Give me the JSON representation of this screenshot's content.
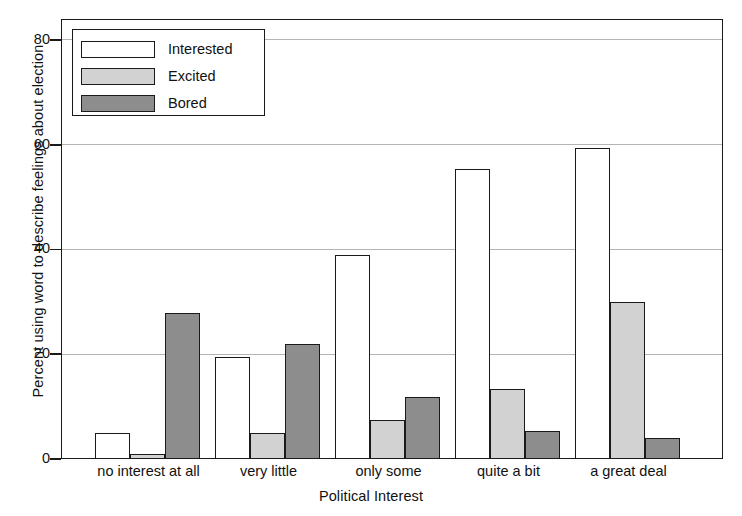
{
  "chart_data": {
    "type": "bar",
    "title": "",
    "xlabel": "Political Interest",
    "ylabel": "Percent using word to describe feelings about election",
    "categories": [
      "no interest at all",
      "very little",
      "only some",
      "quite a bit",
      "a great deal"
    ],
    "series": [
      {
        "name": "Interested",
        "color": "#ffffff",
        "values": [
          5,
          19.5,
          39,
          55.5,
          59.5
        ]
      },
      {
        "name": "Excited",
        "color": "#d2d2d2",
        "values": [
          1,
          5,
          7.5,
          13.5,
          30
        ]
      },
      {
        "name": "Bored",
        "color": "#8d8d8d",
        "values": [
          28,
          22,
          12,
          5.5,
          4
        ]
      }
    ],
    "ylim": [
      0,
      84
    ],
    "yticks": [
      0,
      20,
      40,
      60,
      80
    ],
    "ytick_labels": [
      "0",
      "20",
      "40",
      "60",
      "80"
    ],
    "gridlines": [
      20,
      40,
      60,
      80
    ],
    "grid": true,
    "legend": {
      "position": "top-left",
      "entries": [
        "Interested",
        "Excited",
        "Bored"
      ]
    }
  }
}
